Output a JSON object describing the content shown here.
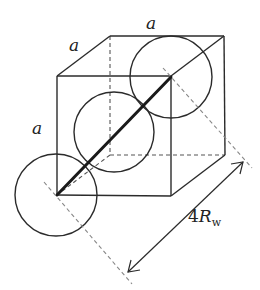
{
  "figure": {
    "labels": {
      "edge_top": "a",
      "edge_depth": "a",
      "edge_left": "a",
      "dimension_prefix": "4",
      "dimension_symbol": "R",
      "dimension_subscript": "w"
    },
    "colors": {
      "line": "#2b2b2b",
      "dashed": "#888888",
      "background": "#ffffff"
    }
  }
}
